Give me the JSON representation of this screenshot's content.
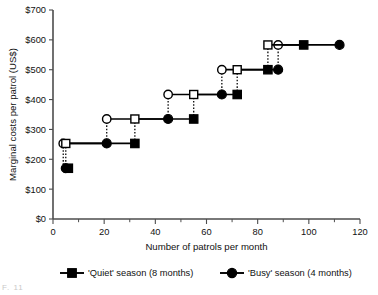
{
  "caption_fragment": "F. 11",
  "axes": {
    "y_title": "Marginal costs per patrol (US$)",
    "x_title": "Number of patrols per month",
    "y_ticks": [
      "$0",
      "$100",
      "$200",
      "$300",
      "$400",
      "$500",
      "$600",
      "$700"
    ],
    "x_ticks": [
      "0",
      "20",
      "40",
      "60",
      "80",
      "100",
      "120"
    ]
  },
  "legend": {
    "items": [
      {
        "label": "'Quiet' season (8 months)",
        "marker": "filled-square",
        "color": "#000000"
      },
      {
        "label": "'Busy' season (4 months)",
        "marker": "filled-circle",
        "color": "#000000"
      }
    ]
  },
  "chart_data": {
    "type": "line",
    "title": "",
    "subtitle": "",
    "xlabel": "Number of patrols per month",
    "ylabel": "Marginal costs per patrol (US$)",
    "xlim": [
      0,
      120
    ],
    "ylim": [
      0,
      700
    ],
    "x_tick_step": 20,
    "x_minor_tick_step": 10,
    "y_tick_step": 100,
    "grid": false,
    "legend_position": "bottom",
    "annotation": "Step function: each series rises in discrete steps of about US$83 per patrol; open markers mark the start of each step, filled markers the end, joined by dotted vertical risers.",
    "series": [
      {
        "name": "'Quiet' season (8 months)",
        "marker": "square",
        "step_start_marker": "open-square",
        "step_end_marker": "filled-square",
        "color": "#000000",
        "steps": [
          {
            "y": 170,
            "x_start": 4,
            "x_end": 6
          },
          {
            "y": 253,
            "x_start": 5,
            "x_end": 32
          },
          {
            "y": 335,
            "x_start": 32,
            "x_end": 55
          },
          {
            "y": 417,
            "x_start": 55,
            "x_end": 72
          },
          {
            "y": 500,
            "x_start": 72,
            "x_end": 84
          },
          {
            "y": 583,
            "x_start": 84,
            "x_end": 98
          }
        ]
      },
      {
        "name": "'Busy' season (4 months)",
        "marker": "circle",
        "step_start_marker": "open-circle",
        "step_end_marker": "filled-circle",
        "color": "#000000",
        "steps": [
          {
            "y": 170,
            "x_start": 4,
            "x_end": 5
          },
          {
            "y": 253,
            "x_start": 4,
            "x_end": 21
          },
          {
            "y": 335,
            "x_start": 21,
            "x_end": 45
          },
          {
            "y": 417,
            "x_start": 45,
            "x_end": 66
          },
          {
            "y": 500,
            "x_start": 66,
            "x_end": 88
          },
          {
            "y": 583,
            "x_start": 88,
            "x_end": 112
          }
        ]
      }
    ]
  }
}
